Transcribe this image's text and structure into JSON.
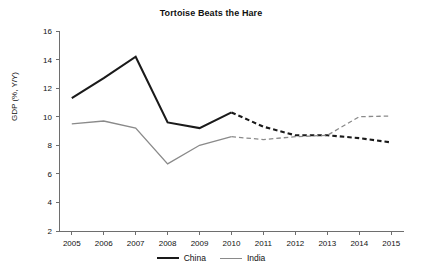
{
  "chart_data": {
    "type": "line",
    "title": "Tortoise Beats the Hare",
    "xlabel": "",
    "ylabel": "GDP (%, Y/Y)",
    "categories": [
      "2005",
      "2006",
      "2007",
      "2008",
      "2009",
      "2010",
      "2011",
      "2012",
      "2013",
      "2014",
      "2015"
    ],
    "x": [
      2005,
      2006,
      2007,
      2008,
      2009,
      2010,
      2011,
      2012,
      2013,
      2014,
      2015
    ],
    "xlim": [
      2004.6,
      2015.4
    ],
    "ylim": [
      2,
      16
    ],
    "yticks": [
      2,
      4,
      6,
      8,
      10,
      12,
      14,
      16
    ],
    "ytick_labels": [
      "2",
      "4",
      "6",
      "8",
      "10",
      "12",
      "14",
      "16"
    ],
    "grid": false,
    "legend_position": "bottom",
    "forecast_starts": "2010",
    "forecast_style": "dashed",
    "series": [
      {
        "name": "China",
        "color": "#1a1a1a",
        "width": 2.1,
        "values": [
          11.3,
          12.7,
          14.2,
          9.6,
          9.2,
          10.3,
          9.3,
          8.7,
          8.7,
          8.5,
          8.2
        ],
        "solid_through": 2010
      },
      {
        "name": "India",
        "color": "#8a8a8a",
        "width": 1.3,
        "values": [
          9.5,
          9.7,
          9.2,
          6.7,
          8.0,
          8.6,
          8.4,
          8.6,
          8.7,
          10.0,
          10.05
        ],
        "solid_through": 2010
      }
    ]
  },
  "legend": {
    "items": [
      {
        "label": "China",
        "color": "#1a1a1a",
        "width": 2.1
      },
      {
        "label": "India",
        "color": "#8a8a8a",
        "width": 1.3
      }
    ]
  }
}
